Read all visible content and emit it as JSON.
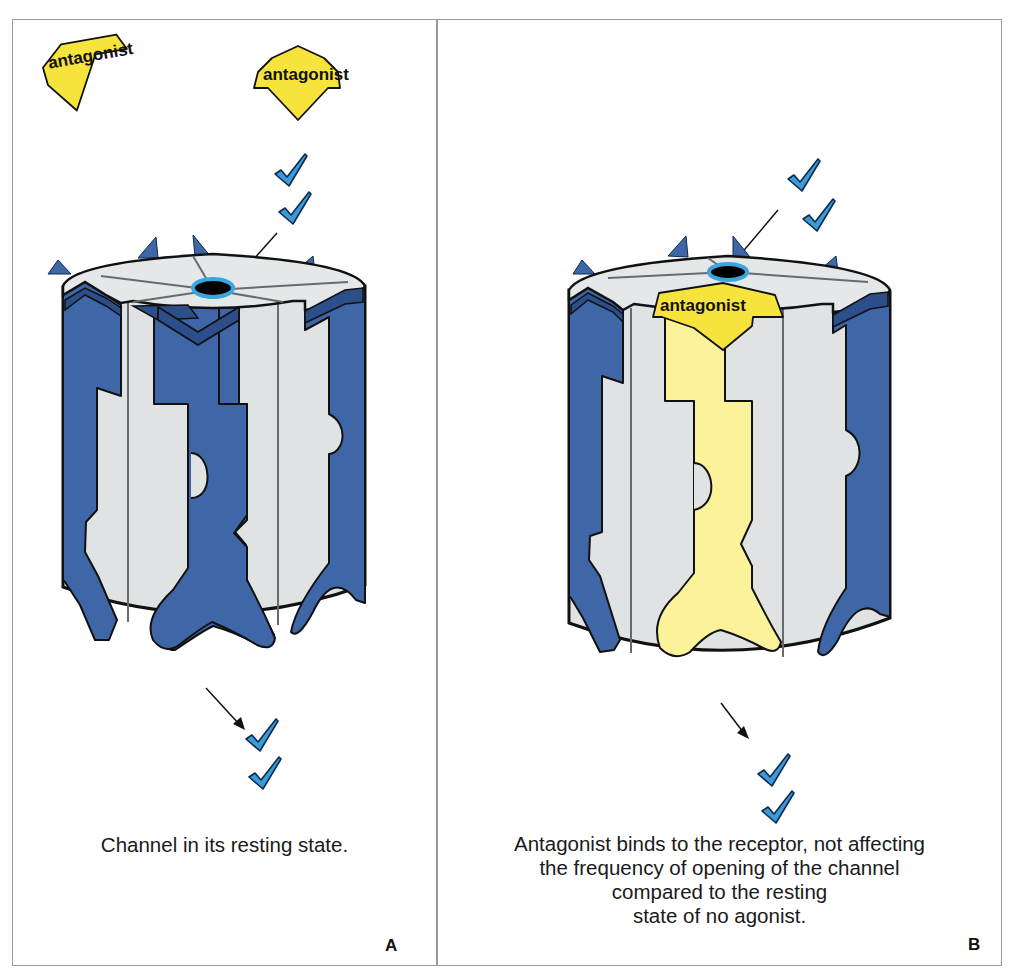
{
  "figure": {
    "colors": {
      "frame": "#9a9a9a",
      "subunit_blue": "#3f66a6",
      "subunit_dark_blue": "#2c4f8c",
      "channel_gray": "#dfe3e4",
      "antagonist_yellow": "#f6e43c",
      "bound_subunit_yellow": "#fbf29a",
      "agonist_check_blue": "#3a9bd8",
      "pore_ring_blue": "#39a6e0",
      "pore_black": "#000000"
    },
    "panels": [
      {
        "id": "A",
        "letter": "A",
        "free_ligands": [
          "antagonist",
          "antagonist"
        ],
        "bound_ligand": null,
        "agonist_glyphs_in": 2,
        "agonist_glyphs_out": 2,
        "caption": "Channel in its resting state."
      },
      {
        "id": "B",
        "letter": "B",
        "free_ligands": [],
        "bound_ligand": "antagonist",
        "agonist_glyphs_in": 2,
        "agonist_glyphs_out": 2,
        "caption_lines": [
          "Antagonist binds to the receptor, not affecting",
          "the frequency of opening of the channel",
          "compared to the resting",
          "state of no agonist."
        ]
      }
    ]
  }
}
